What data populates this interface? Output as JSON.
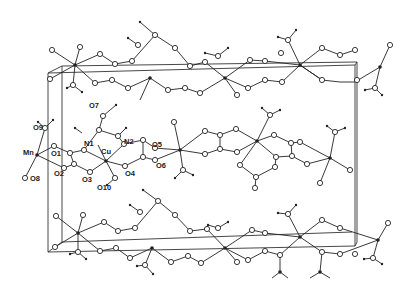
{
  "figure": {
    "atom_labels": [
      {
        "id": "O7",
        "text": "O7",
        "x": 91,
        "y": 106
      },
      {
        "id": "O9",
        "text": "O9",
        "x": 34,
        "y": 128
      },
      {
        "id": "N1",
        "text": "N1",
        "x": 84,
        "y": 143
      },
      {
        "id": "N2",
        "text": "N2",
        "x": 125,
        "y": 140
      },
      {
        "id": "Mn",
        "text": "Mn",
        "x": 25,
        "y": 151
      },
      {
        "id": "O1",
        "text": "O1",
        "x": 51,
        "y": 151
      },
      {
        "id": "Cu",
        "text": "Cu",
        "x": 101,
        "y": 150
      },
      {
        "id": "O5",
        "text": "O5",
        "x": 152,
        "y": 143
      },
      {
        "id": "O6",
        "text": "O6",
        "x": 158,
        "y": 164
      },
      {
        "id": "O2",
        "text": "O2",
        "x": 52,
        "y": 166
      },
      {
        "id": "O3",
        "text": "O3",
        "x": 82,
        "y": 170
      },
      {
        "id": "O4",
        "text": "O4",
        "x": 124,
        "y": 170
      },
      {
        "id": "O8",
        "text": "O8",
        "x": 30,
        "y": 178
      },
      {
        "id": "O10",
        "text": "O10",
        "x": 98,
        "y": 186
      }
    ]
  }
}
